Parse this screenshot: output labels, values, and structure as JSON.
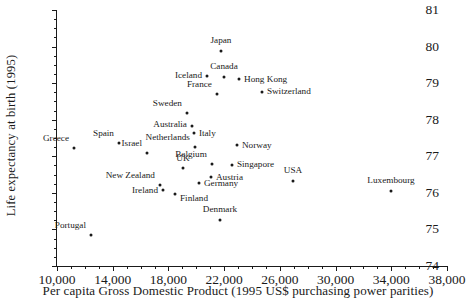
{
  "chart_data": {
    "type": "scatter",
    "title": "",
    "xlabel": "Per capita Gross Domestic Product (1995 US$ purchasing power parities)",
    "ylabel": "Life expectancy at birth (1995)",
    "xlim": [
      10000,
      38000
    ],
    "ylim": [
      74,
      81
    ],
    "xticks": [
      "10,000",
      "14,000",
      "18,000",
      "22,000",
      "26,000",
      "30,000",
      "34,000",
      "38,000"
    ],
    "xtick_values": [
      10000,
      14000,
      18000,
      22000,
      26000,
      30000,
      34000,
      38000
    ],
    "x_minor_step": 1000,
    "yticks": [
      "74",
      "75",
      "76",
      "77",
      "78",
      "79",
      "80",
      "81"
    ],
    "ytick_values": [
      74,
      75,
      76,
      77,
      78,
      79,
      80,
      81
    ],
    "y_minor_step": 0.25,
    "grid": false,
    "legend": false,
    "points": [
      {
        "label": "Greece",
        "x": 11220,
        "y": 77.23,
        "lx": -5,
        "ly": -9,
        "anchor": "right"
      },
      {
        "label": "Portugal",
        "x": 12440,
        "y": 74.85,
        "lx": -5,
        "ly": -9,
        "anchor": "right"
      },
      {
        "label": "Spain",
        "x": 14450,
        "y": 77.36,
        "lx": -5,
        "ly": -9,
        "anchor": "right"
      },
      {
        "label": "Israel",
        "x": 16460,
        "y": 77.09,
        "lx": -5,
        "ly": -9,
        "anchor": "right"
      },
      {
        "label": "New Zealand",
        "x": 17390,
        "y": 76.22,
        "lx": -5,
        "ly": -9,
        "anchor": "right"
      },
      {
        "label": "Ireland",
        "x": 17610,
        "y": 76.09,
        "lx": -5,
        "ly": 1,
        "anchor": "right"
      },
      {
        "label": "Finland",
        "x": 18470,
        "y": 75.98,
        "lx": 5,
        "ly": 5,
        "anchor": "left"
      },
      {
        "label": "Sweden",
        "x": 19330,
        "y": 78.18,
        "lx": -5,
        "ly": -9,
        "anchor": "right"
      },
      {
        "label": "Australia",
        "x": 19690,
        "y": 77.82,
        "lx": -5,
        "ly": -1,
        "anchor": "right"
      },
      {
        "label": "Italy",
        "x": 19830,
        "y": 77.64,
        "lx": 5,
        "ly": 1,
        "anchor": "left"
      },
      {
        "label": "Netherlands",
        "x": 19900,
        "y": 77.26,
        "lx": -5,
        "ly": -9,
        "anchor": "right"
      },
      {
        "label": "UK",
        "x": 19040,
        "y": 76.69,
        "lx": 0,
        "ly": -9,
        "anchor": "mid"
      },
      {
        "label": "Germany",
        "x": 20190,
        "y": 76.28,
        "lx": 5,
        "ly": 1,
        "anchor": "left"
      },
      {
        "label": "Belgium",
        "x": 21120,
        "y": 76.8,
        "lx": -5,
        "ly": -9,
        "anchor": "right"
      },
      {
        "label": "Austria",
        "x": 21050,
        "y": 76.44,
        "lx": 5,
        "ly": 1,
        "anchor": "left"
      },
      {
        "label": "Denmark",
        "x": 21700,
        "y": 75.26,
        "lx": 0,
        "ly": -10,
        "anchor": "mid"
      },
      {
        "label": "France",
        "x": 21480,
        "y": 78.69,
        "lx": -5,
        "ly": -9,
        "anchor": "right"
      },
      {
        "label": "Japan",
        "x": 21770,
        "y": 79.88,
        "lx": 0,
        "ly": -10,
        "anchor": "mid"
      },
      {
        "label": "Iceland",
        "x": 20770,
        "y": 79.19,
        "lx": -5,
        "ly": 0,
        "anchor": "right"
      },
      {
        "label": "Canada",
        "x": 21990,
        "y": 79.16,
        "lx": 0,
        "ly": -10,
        "anchor": "mid"
      },
      {
        "label": "Hong Kong",
        "x": 23070,
        "y": 79.12,
        "lx": 5,
        "ly": 1,
        "anchor": "left"
      },
      {
        "label": "Singapore",
        "x": 22560,
        "y": 76.77,
        "lx": 5,
        "ly": 0,
        "anchor": "left"
      },
      {
        "label": "Norway",
        "x": 22920,
        "y": 77.3,
        "lx": 5,
        "ly": 1,
        "anchor": "left"
      },
      {
        "label": "Switzerland",
        "x": 24710,
        "y": 78.76,
        "lx": 5,
        "ly": 0,
        "anchor": "left"
      },
      {
        "label": "USA",
        "x": 26940,
        "y": 76.33,
        "lx": 0,
        "ly": -10,
        "anchor": "mid"
      },
      {
        "label": "Luxembourg",
        "x": 33980,
        "y": 76.06,
        "lx": 0,
        "ly": -10,
        "anchor": "mid"
      }
    ]
  }
}
